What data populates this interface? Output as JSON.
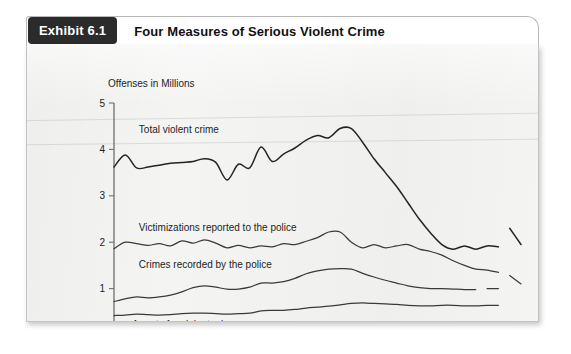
{
  "exhibit": {
    "badge": "Exhibit 6.1",
    "title": "Four Measures of Serious Violent Crime"
  },
  "chart_data": {
    "type": "line",
    "title": "Four Measures of Serious Violent Crime",
    "xlabel": "",
    "ylabel": "Offenses in Millions",
    "ylabel_text": "Offenses in Millions",
    "xlim": [
      1973,
      2009
    ],
    "ylim": [
      0,
      5
    ],
    "yticks": [
      0,
      1,
      2,
      3,
      4,
      5
    ],
    "ytick_labels": [
      "0",
      "1",
      "2",
      "3",
      "4",
      "5"
    ],
    "xticks": [
      1973,
      1975,
      1977,
      1979,
      1981,
      1983,
      1985,
      1987,
      1989,
      1991,
      1993,
      1995,
      1997,
      1999,
      2001,
      2003,
      2005,
      2007,
      2009
    ],
    "xtick_labels_shown": [
      "1973",
      "1991",
      "2009"
    ],
    "xtick_label_years": [
      1973,
      1991,
      2009
    ],
    "grid": false,
    "legend_position": "inline-annotations",
    "x": [
      1973,
      1974,
      1975,
      1976,
      1977,
      1978,
      1979,
      1980,
      1981,
      1982,
      1983,
      1984,
      1985,
      1986,
      1987,
      1988,
      1989,
      1990,
      1991,
      1992,
      1993,
      1994,
      1995,
      1996,
      1997,
      1998,
      1999,
      2000,
      2001,
      2002,
      2003,
      2004,
      2005,
      2006,
      2007,
      2008,
      2009
    ],
    "series": [
      {
        "name": "Total violent crime",
        "label": "Total violent crime",
        "label_x": 1975.2,
        "label_y": 4.42,
        "values": [
          3.62,
          3.88,
          3.6,
          3.62,
          3.66,
          3.7,
          3.72,
          3.74,
          3.8,
          3.72,
          3.34,
          3.68,
          3.6,
          4.05,
          3.74,
          3.9,
          4.03,
          4.2,
          4.3,
          4.25,
          4.45,
          4.45,
          4.15,
          3.8,
          3.5,
          3.2,
          2.85,
          2.5,
          2.2,
          1.95,
          1.85,
          1.92,
          1.85,
          1.92,
          1.9,
          null,
          null
        ],
        "break_after_year": 2007,
        "tail_x": [
          2008,
          2009
        ],
        "tail_values": [
          2.3,
          1.95
        ]
      },
      {
        "name": "Victimizations reported to the police",
        "label": "Victimizations reported to the police",
        "label_x": 1975.2,
        "label_y": 2.32,
        "values": [
          1.86,
          2.0,
          1.97,
          1.93,
          1.97,
          1.92,
          2.03,
          1.98,
          2.05,
          1.98,
          1.88,
          1.93,
          1.88,
          1.92,
          1.9,
          1.97,
          1.95,
          2.02,
          2.1,
          2.22,
          2.22,
          2.0,
          1.88,
          1.95,
          1.88,
          1.92,
          1.95,
          1.85,
          1.8,
          1.72,
          1.6,
          1.5,
          1.42,
          1.4,
          1.35,
          null,
          null
        ],
        "break_after_year": 2007,
        "tail_x": [
          2008,
          2009
        ],
        "tail_values": [
          1.28,
          1.1
        ]
      },
      {
        "name": "Crimes recorded by the police",
        "label": "Crimes recorded by the police",
        "label_x": 1975.2,
        "label_y": 1.52,
        "values": [
          0.72,
          0.78,
          0.82,
          0.8,
          0.82,
          0.86,
          0.93,
          1.02,
          1.06,
          1.03,
          0.99,
          0.99,
          1.03,
          1.12,
          1.12,
          1.15,
          1.22,
          1.32,
          1.38,
          1.42,
          1.43,
          1.42,
          1.33,
          1.25,
          1.18,
          1.12,
          1.06,
          1.02,
          1.0,
          1.0,
          0.99,
          0.98,
          0.98,
          null,
          null,
          null,
          null
        ],
        "break_after_year": 2005,
        "tail_x": [
          2006,
          2007
        ],
        "tail_values": [
          1.0,
          1.0
        ]
      },
      {
        "name": "Arrests for violent crime",
        "label": "Arrests for violent crime",
        "label_x": 1974.6,
        "label_y": 0.22,
        "values": [
          0.42,
          0.43,
          0.45,
          0.44,
          0.43,
          0.44,
          0.46,
          0.47,
          0.47,
          0.46,
          0.45,
          0.46,
          0.47,
          0.52,
          0.53,
          0.53,
          0.55,
          0.58,
          0.6,
          0.62,
          0.65,
          0.68,
          0.69,
          0.68,
          0.67,
          0.66,
          0.64,
          0.63,
          0.63,
          0.64,
          0.64,
          0.63,
          0.63,
          0.64,
          0.64,
          null,
          null
        ],
        "break_after_year": null,
        "tail_x": [],
        "tail_values": []
      }
    ]
  },
  "colors": {
    "badge_bg": "#2b2b2b",
    "badge_text": "#ffffff",
    "panel_bg": "#f4f4f3",
    "line": "#232323",
    "axis": "#6f6f6f"
  }
}
